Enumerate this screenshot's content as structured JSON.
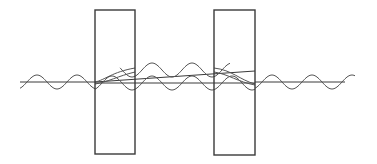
{
  "diagram": {
    "title": "Light wave passing through two parallel plates (reflection / refraction interference)",
    "colors": {
      "background": "#ffffff",
      "stroke": "#3a3a3a",
      "wave": "#555555"
    },
    "plates": [
      {
        "name": "plate-1",
        "x": 95,
        "y": 10,
        "width": 40,
        "height": 144
      },
      {
        "name": "plate-2",
        "x": 214,
        "y": 10,
        "width": 41,
        "height": 145
      }
    ],
    "axis_lines": [
      {
        "name": "incident-axis",
        "x1": 20,
        "y1": 82,
        "x2": 95,
        "y2": 82
      },
      {
        "name": "gap-upper-axis",
        "x1": 95,
        "y1": 82,
        "x2": 255,
        "y2": 71
      },
      {
        "name": "gap-lower-axis",
        "x1": 95,
        "y1": 83,
        "x2": 255,
        "y2": 83
      },
      {
        "name": "transmitted-axis",
        "x1": 255,
        "y1": 82,
        "x2": 345,
        "y2": 82
      }
    ],
    "waves": {
      "amplitude": 7,
      "wavelength": 40,
      "incident": {
        "x_start": 20,
        "x_end": 95,
        "center_y": 82,
        "first_peak_x": 37
      },
      "gap_upper": {
        "x_start": 120,
        "x_end": 230,
        "center_y": 70,
        "first_peak_x": 152
      },
      "gap_lower": {
        "x_start": 95,
        "x_end": 255,
        "center_y": 83,
        "first_peak_x": 152
      },
      "transmitted": {
        "x_start": 255,
        "x_end": 355,
        "center_y": 82,
        "first_peak_x": 272
      }
    }
  }
}
